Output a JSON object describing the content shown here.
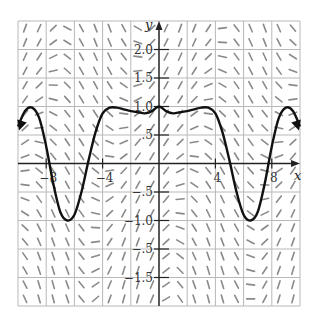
{
  "chart_data": {
    "type": "line",
    "subtype": "slope-field-with-solution-curve",
    "title": "",
    "xlabel": "x",
    "ylabel": "y",
    "xlim": [
      -10,
      10
    ],
    "ylim": [
      -2.5,
      2.5
    ],
    "grid": true,
    "grid_spacing": {
      "x": 2,
      "y": 0.5
    },
    "x_ticks": [
      {
        "value": -8,
        "label": "−8"
      },
      {
        "value": -4,
        "label": "−4"
      },
      {
        "value": 4,
        "label": "4"
      },
      {
        "value": 8,
        "label": "8"
      }
    ],
    "y_ticks": [
      {
        "value": 2.0,
        "label": "2.0"
      },
      {
        "value": 1.5,
        "label": "1.5"
      },
      {
        "value": 1.0,
        "label": "1.0"
      },
      {
        "value": 0.5,
        "label": ".5"
      },
      {
        "value": -0.5,
        "label": "−.5"
      },
      {
        "value": -1.0,
        "label": "−1.0"
      },
      {
        "value": -1.5,
        "label": "−.5"
      },
      {
        "value": -2.0,
        "label": "−1.5"
      }
    ],
    "series": [
      {
        "name": "solution curve",
        "color": "#111111",
        "x": [
          -10,
          -9.5,
          -9,
          -8.5,
          -8,
          -7.5,
          -7,
          -6.5,
          -6,
          -5.5,
          -5,
          -4.5,
          -4,
          -3.5,
          -3,
          -2.5,
          -2,
          -1.5,
          -1,
          -0.5,
          0,
          0.5,
          1,
          1.5,
          2,
          2.5,
          3,
          3.5,
          4,
          4.5,
          5,
          5.5,
          6,
          6.5,
          7,
          7.5,
          8,
          8.5,
          9,
          9.5,
          10
        ],
        "y": [
          0.65,
          0.92,
          0.98,
          0.8,
          0.3,
          -0.35,
          -0.85,
          -1.0,
          -0.9,
          -0.5,
          0.05,
          0.55,
          0.88,
          0.98,
          0.98,
          0.95,
          0.92,
          0.9,
          0.88,
          0.92,
          1.0,
          0.92,
          0.88,
          0.9,
          0.92,
          0.95,
          0.98,
          0.98,
          0.88,
          0.55,
          0.05,
          -0.5,
          -0.9,
          -1.0,
          -0.85,
          -0.35,
          0.3,
          0.8,
          0.98,
          0.92,
          0.65
        ],
        "arrows_at_ends": true
      }
    ],
    "annotations": [
      {
        "text": "minimum",
        "x": -6.5,
        "y": -1.0
      },
      {
        "text": "minimum",
        "x": 6.5,
        "y": -1.0
      },
      {
        "text": "local min",
        "x": -1,
        "y": 0.85
      },
      {
        "text": "local min",
        "x": 1,
        "y": 0.85
      }
    ]
  },
  "labels": {
    "x_axis": "x",
    "y_axis": "y"
  },
  "colors": {
    "grid": "#b8b8b8",
    "axis": "#222222",
    "curve": "#111111",
    "segments": "#8a8a8a"
  }
}
